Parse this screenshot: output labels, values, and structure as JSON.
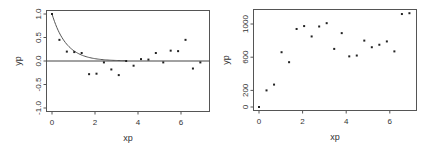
{
  "chart_data": [
    {
      "type": "scatter",
      "title": "",
      "xlabel": "xp",
      "ylabel": "yp",
      "xlim": [
        -0.2,
        7.1
      ],
      "ylim": [
        -1.1,
        1.1
      ],
      "xticks": [
        "0",
        "2",
        "4",
        "6"
      ],
      "yticks": [
        "-1.0",
        "-0.5",
        "0.0",
        "0.5",
        "1.0"
      ],
      "grid": false,
      "x": [
        0.0,
        0.345,
        0.69,
        1.035,
        1.38,
        1.725,
        2.07,
        2.415,
        2.76,
        3.105,
        3.45,
        3.795,
        4.14,
        4.485,
        4.83,
        5.175,
        5.52,
        5.865,
        6.21,
        6.555,
        6.9
      ],
      "y": [
        1.0,
        0.45,
        0.2,
        0.19,
        0.17,
        -0.28,
        -0.27,
        -0.03,
        -0.18,
        -0.3,
        0.0,
        -0.1,
        0.04,
        0.03,
        0.17,
        -0.03,
        0.22,
        0.21,
        0.45,
        -0.16,
        -0.03
      ],
      "overlays": [
        {
          "type": "line",
          "description": "exponential decay curve y = exp(-1.5x)",
          "x_range": [
            0,
            3.4
          ]
        },
        {
          "type": "hline",
          "y": 0
        }
      ]
    },
    {
      "type": "scatter",
      "title": "",
      "xlabel": "xp",
      "ylabel": "yp",
      "xlim": [
        -0.2,
        7.1
      ],
      "ylim": [
        -20,
        1180
      ],
      "xticks": [
        "0",
        "2",
        "4",
        "6"
      ],
      "yticks": [
        "0",
        "200",
        "600",
        "1000"
      ],
      "grid": false,
      "x": [
        0.0,
        0.345,
        0.69,
        1.035,
        1.38,
        1.725,
        2.07,
        2.415,
        2.76,
        3.105,
        3.45,
        3.795,
        4.14,
        4.485,
        4.83,
        5.175,
        5.52,
        5.865,
        6.21,
        6.555,
        6.9
      ],
      "y": [
        0,
        200,
        270,
        660,
        540,
        940,
        975,
        850,
        970,
        1010,
        700,
        890,
        610,
        620,
        800,
        720,
        750,
        790,
        670,
        1120,
        1130
      ]
    }
  ],
  "plots": [
    {
      "xlabel": "xp",
      "ylabel": "yp",
      "xticks": [
        "0",
        "2",
        "4",
        "6"
      ],
      "yticks": [
        "-1.0",
        "-0.5",
        "0.0",
        "0.5",
        "1.0"
      ]
    },
    {
      "xlabel": "xp",
      "ylabel": "yp",
      "xticks": [
        "0",
        "2",
        "4",
        "6"
      ],
      "yticks": [
        "0",
        "200",
        "600",
        "1000"
      ]
    }
  ]
}
